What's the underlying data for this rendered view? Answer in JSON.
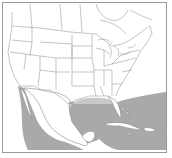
{
  "map": {
    "title": "",
    "region": "North America (USA, Mexico, Caribbean)",
    "colors": {
      "background": "#ffffff",
      "land": "#ffffff",
      "border_lines": "#8a8a8a",
      "frame": "#9a9a9a",
      "range_dark": "#a9a9a9",
      "range_light": "#c9c9c9"
    },
    "layers": [
      {
        "name": "state-borders",
        "type": "line"
      },
      {
        "name": "range-pacific-mexico",
        "type": "shaded-area",
        "shade": "dark"
      },
      {
        "name": "range-gulf-north",
        "type": "shaded-area",
        "shade": "light"
      },
      {
        "name": "range-gulf-south-caribbean",
        "type": "shaded-area",
        "shade": "dark"
      },
      {
        "name": "range-atlantic",
        "type": "shaded-area",
        "shade": "dark"
      }
    ]
  }
}
